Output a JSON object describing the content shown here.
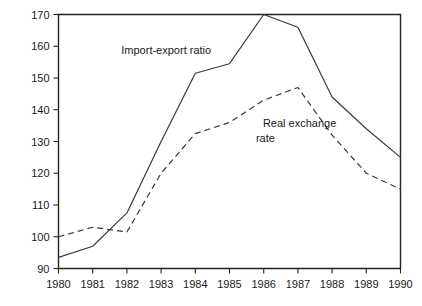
{
  "chart_data": {
    "type": "line",
    "title": "",
    "xlabel": "",
    "ylabel": "",
    "x": [
      1980,
      1981,
      1982,
      1983,
      1984,
      1985,
      1986,
      1987,
      1988,
      1989,
      1990
    ],
    "categories": [
      "1980",
      "1981",
      "1982",
      "1983",
      "1984",
      "1985",
      "1986",
      "1987",
      "1988",
      "1989",
      "1990"
    ],
    "xlim": [
      1980,
      1990
    ],
    "ylim": [
      90,
      170
    ],
    "yticks": [
      90,
      100,
      110,
      120,
      130,
      140,
      150,
      160,
      170
    ],
    "ytick_labels": [
      "90",
      "100",
      "110",
      "120",
      "130",
      "140",
      "150",
      "160",
      "170"
    ],
    "grid": false,
    "legend": "inline-annotations",
    "series": [
      {
        "name": "Import-export ratio",
        "style": "solid",
        "color": "#3a3a3a",
        "values": [
          93.5,
          97.0,
          107.5,
          130.0,
          151.5,
          154.5,
          170.0,
          166.0,
          144.0,
          134.0,
          125.0
        ]
      },
      {
        "name": "Real exchange rate",
        "style": "dashed",
        "color": "#3a3a3a",
        "values": [
          100.0,
          103.0,
          101.5,
          120.0,
          132.5,
          136.0,
          143.0,
          147.0,
          132.0,
          120.0,
          115.0
        ]
      }
    ],
    "annotations": [
      {
        "text": "Import-export ratio",
        "x": 1983.15,
        "y": 157.5,
        "align": "middle"
      },
      {
        "text": "Real exchange",
        "x": 1987.05,
        "y": 134.5,
        "align": "middle"
      },
      {
        "text": "rate",
        "x": 1986.05,
        "y": 129.8,
        "align": "middle"
      }
    ]
  }
}
